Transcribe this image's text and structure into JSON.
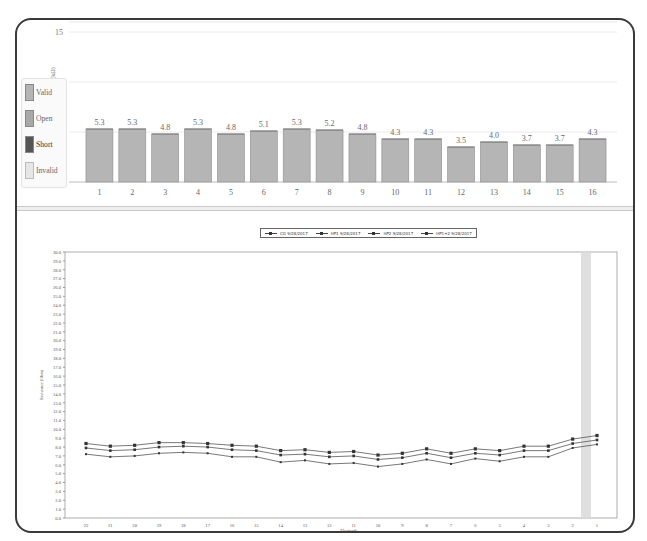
{
  "impedance_legend": {
    "items": [
      {
        "label": "Valid",
        "color": "#b5b5b5"
      },
      {
        "label": "Open",
        "color": "#a9a9a9"
      },
      {
        "label": "Short",
        "color": "#555555"
      },
      {
        "label": "Invalid",
        "color": "#e6e6e6"
      }
    ]
  },
  "line_legend": {
    "items": [
      {
        "label": "CG 9/28/2017"
      },
      {
        "label": "HP1 9/28/2017"
      },
      {
        "label": "HP2 9/28/2017"
      },
      {
        "label": "HP1+2 9/28/2017"
      }
    ]
  },
  "chart_data": [
    {
      "type": "bar",
      "title": "",
      "xlabel": "",
      "ylabel": "Impedance (kΩ)",
      "ylim": [
        0,
        15
      ],
      "yticks": [
        0,
        5,
        10,
        15
      ],
      "grid": true,
      "legend_position": "left",
      "categories": [
        "1",
        "2",
        "3",
        "4",
        "5",
        "6",
        "7",
        "8",
        "9",
        "10",
        "11",
        "12",
        "13",
        "14",
        "15",
        "16"
      ],
      "values": [
        5.3,
        5.3,
        4.8,
        5.3,
        4.8,
        5.1,
        5.3,
        5.2,
        4.8,
        4.3,
        4.3,
        3.5,
        4.0,
        3.7,
        3.7,
        4.3
      ],
      "value_labels": [
        "5.3",
        "5.3",
        "4.8",
        "5.3",
        "4.8",
        "5.1",
        "5.3",
        "5.2",
        "4.8",
        "4.3",
        "4.3",
        "3.5",
        "4.0",
        "3.7",
        "3.7",
        "4.3"
      ],
      "bar_color": "#b5b5b5"
    },
    {
      "type": "line",
      "title": "",
      "xlabel": "Electrode",
      "ylabel": "Resistance (Ohm)",
      "ylim": [
        0,
        30
      ],
      "yticks": [
        "0.0",
        "1.0",
        "2.0",
        "3.0",
        "4.0",
        "5.0",
        "6.0",
        "7.0",
        "8.0",
        "9.0",
        "10.0",
        "11.0",
        "12.0",
        "13.0",
        "14.0",
        "15.0",
        "16.0",
        "17.0",
        "18.0",
        "19.0",
        "20.0",
        "21.0",
        "22.0",
        "23.0",
        "24.0",
        "25.0",
        "26.0",
        "27.0",
        "28.0",
        "29.0",
        "30.0"
      ],
      "grid": false,
      "legend_position": "top",
      "categories": [
        "22",
        "21",
        "20",
        "19",
        "18",
        "17",
        "16",
        "15",
        "14",
        "13",
        "12",
        "11",
        "10",
        "9",
        "8",
        "7",
        "6",
        "5",
        "4",
        "3",
        "2",
        "1"
      ],
      "highlight_category": "1",
      "series": [
        {
          "name": "HP1 9/28/2017",
          "marker": "square",
          "values": [
            8.4,
            8.1,
            8.2,
            8.5,
            8.5,
            8.4,
            8.2,
            8.1,
            7.6,
            7.7,
            7.4,
            7.5,
            7.1,
            7.3,
            7.8,
            7.3,
            7.8,
            7.6,
            8.1,
            8.1,
            8.9,
            9.3
          ]
        },
        {
          "name": "HP2 9/28/2017",
          "marker": "triangle",
          "values": [
            7.9,
            7.6,
            7.7,
            8.0,
            8.1,
            8.0,
            7.7,
            7.6,
            7.1,
            7.2,
            6.9,
            7.0,
            6.6,
            6.8,
            7.3,
            6.8,
            7.3,
            7.1,
            7.6,
            7.6,
            8.4,
            8.8
          ]
        },
        {
          "name": "CG 9/28/2017",
          "marker": "diamond",
          "values": [
            7.2,
            6.9,
            7.0,
            7.3,
            7.4,
            7.3,
            6.9,
            6.9,
            6.3,
            6.5,
            6.1,
            6.2,
            5.8,
            6.1,
            6.6,
            6.1,
            6.7,
            6.4,
            6.9,
            6.9,
            7.9,
            8.3
          ]
        }
      ]
    }
  ]
}
